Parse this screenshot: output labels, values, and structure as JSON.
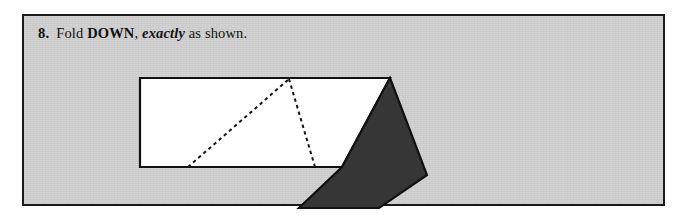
{
  "page": {
    "width": 681,
    "height": 222,
    "background_color": "#ffffff"
  },
  "panel": {
    "name": "instruction-panel",
    "background_color": "#d2d2d2",
    "border_color": "#1b1b1b",
    "x": 22,
    "y": 14,
    "width": 643,
    "height": 192
  },
  "caption": {
    "step_number": "8.",
    "text_before_italic": "Fold ",
    "emphasis_caps": "DOWN",
    "comma": ", ",
    "italic_word": "exactly",
    "text_after_italic": " as shown.",
    "full_text": "8. Fold DOWN, exactly as shown.",
    "color": "#121212"
  },
  "diagram": {
    "name": "origami-fold-step-diagram",
    "white_sheet": {
      "fill": "#ffffff",
      "stroke": "#111111",
      "stroke_width": 2.2,
      "points": "116,62 366,62 318,151 116,151"
    },
    "dark_flap": {
      "fill": "#363636",
      "stroke": "#111111",
      "stroke_width": 2.2,
      "points": "366,62 403,159 355,192 275,192 318,151"
    },
    "crease_lines": [
      {
        "name": "crease-left-diagonal",
        "from": [
          164,
          151
        ],
        "to": [
          265,
          63
        ],
        "style": "dashed"
      },
      {
        "name": "crease-right-diagonal",
        "from": [
          265,
          63
        ],
        "to": [
          291,
          151
        ],
        "style": "dashed"
      }
    ],
    "crease_color": "#151515",
    "crease_dash": "3.4 3.4",
    "crease_width": 2.0
  }
}
